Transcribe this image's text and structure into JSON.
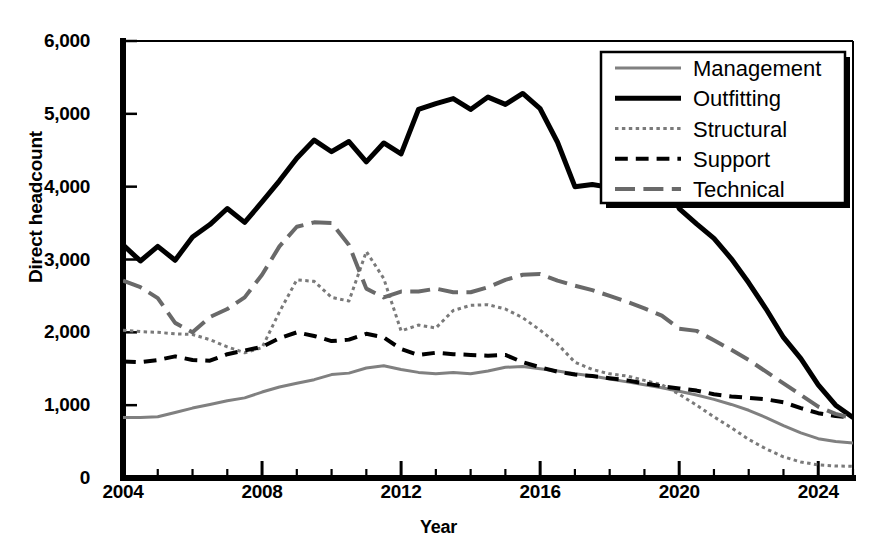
{
  "chart_data": {
    "type": "line",
    "title": "",
    "xlabel": "Year",
    "ylabel": "Direct headcount",
    "xlim": [
      2004,
      2025
    ],
    "ylim": [
      0,
      6000
    ],
    "grid": false,
    "legend_position": "top-right",
    "x_tick_labels": [
      "2004",
      "2008",
      "2012",
      "2016",
      "2020",
      "2024"
    ],
    "x_tick_values": [
      2004,
      2008,
      2012,
      2016,
      2020,
      2024
    ],
    "x_minor_tick_step": 1,
    "y_tick_labels": [
      "0",
      "1,000",
      "2,000",
      "3,000",
      "4,000",
      "5,000",
      "6,000"
    ],
    "y_tick_values": [
      0,
      1000,
      2000,
      3000,
      4000,
      5000,
      6000
    ],
    "x": [
      2004,
      2004.5,
      2005,
      2005.5,
      2006,
      2006.5,
      2007,
      2007.5,
      2008,
      2008.5,
      2009,
      2009.5,
      2010,
      2010.5,
      2011,
      2011.5,
      2012,
      2012.5,
      2013,
      2013.5,
      2014,
      2014.5,
      2015,
      2015.5,
      2016,
      2016.5,
      2017,
      2017.5,
      2018,
      2018.5,
      2019,
      2019.5,
      2020,
      2020.5,
      2021,
      2021.5,
      2022,
      2022.5,
      2023,
      2023.5,
      2024,
      2024.5,
      2025
    ],
    "series": [
      {
        "name": "Management",
        "style": "solid",
        "color": "#808080",
        "width": 3,
        "values": [
          830,
          830,
          840,
          900,
          960,
          1010,
          1060,
          1100,
          1180,
          1250,
          1300,
          1350,
          1420,
          1440,
          1510,
          1540,
          1490,
          1450,
          1430,
          1450,
          1430,
          1470,
          1520,
          1530,
          1500,
          1470,
          1430,
          1400,
          1360,
          1320,
          1280,
          1240,
          1190,
          1140,
          1080,
          1010,
          930,
          830,
          720,
          620,
          540,
          500,
          480
        ]
      },
      {
        "name": "Outfitting",
        "style": "solid",
        "color": "#000000",
        "width": 5,
        "values": [
          3200,
          2980,
          3180,
          2990,
          3310,
          3480,
          3700,
          3510,
          3790,
          4080,
          4390,
          4640,
          4480,
          4620,
          4340,
          4600,
          4450,
          5060,
          5140,
          5210,
          5060,
          5230,
          5130,
          5280,
          5070,
          4610,
          4000,
          4030,
          3990,
          4280,
          4110,
          4190,
          3700,
          3490,
          3290,
          3010,
          2680,
          2320,
          1930,
          1640,
          1280,
          1000,
          830
        ]
      },
      {
        "name": "Structural",
        "style": "dotted",
        "color": "#7a7a7a",
        "width": 3,
        "values": [
          2030,
          2010,
          2000,
          1980,
          1970,
          1900,
          1800,
          1720,
          1790,
          2280,
          2720,
          2700,
          2480,
          2430,
          3110,
          2740,
          2020,
          2100,
          2060,
          2300,
          2370,
          2380,
          2320,
          2200,
          2030,
          1840,
          1590,
          1490,
          1430,
          1400,
          1340,
          1280,
          1150,
          1000,
          840,
          690,
          530,
          400,
          290,
          220,
          180,
          165,
          160
        ]
      },
      {
        "name": "Support",
        "style": "dashed",
        "color": "#000000",
        "width": 4,
        "values": [
          1600,
          1590,
          1620,
          1670,
          1620,
          1610,
          1700,
          1750,
          1800,
          1920,
          2000,
          1950,
          1880,
          1900,
          1980,
          1930,
          1770,
          1690,
          1720,
          1700,
          1690,
          1680,
          1690,
          1590,
          1520,
          1460,
          1420,
          1400,
          1370,
          1340,
          1300,
          1260,
          1230,
          1200,
          1150,
          1120,
          1100,
          1080,
          1040,
          960,
          890,
          850,
          830
        ]
      },
      {
        "name": "Technical",
        "style": "longdash",
        "color": "#696969",
        "width": 4,
        "values": [
          2710,
          2620,
          2470,
          2130,
          2000,
          2210,
          2320,
          2480,
          2790,
          3180,
          3450,
          3510,
          3500,
          3200,
          2600,
          2480,
          2560,
          2560,
          2600,
          2550,
          2550,
          2620,
          2720,
          2790,
          2800,
          2710,
          2640,
          2580,
          2500,
          2420,
          2330,
          2230,
          2050,
          2020,
          1890,
          1760,
          1620,
          1460,
          1300,
          1140,
          980,
          880,
          820
        ]
      }
    ]
  }
}
